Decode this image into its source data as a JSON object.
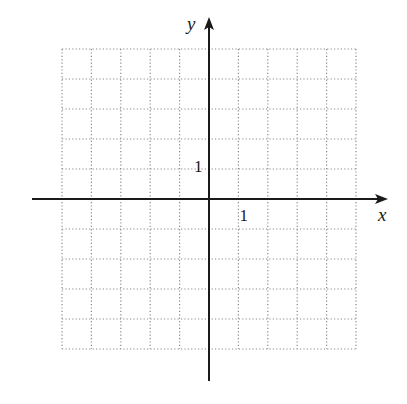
{
  "chart_data": {
    "type": "coordinate-grid",
    "title": "",
    "xlabel": "x",
    "ylabel": "y",
    "xlim": [
      -5,
      5
    ],
    "ylim": [
      -5,
      5
    ],
    "grid": true,
    "grid_style": "dotted",
    "grid_step": 1,
    "axes_extent": {
      "x": [
        -6,
        6
      ],
      "y": [
        -6,
        6
      ]
    },
    "x_tick_labels": [
      {
        "value": 1,
        "label": "1"
      }
    ],
    "y_tick_labels": [
      {
        "value": 1,
        "label": "1"
      }
    ],
    "series": []
  },
  "colors": {
    "axis": "#1a1a1a",
    "grid": "#8a8a8a",
    "background": "#ffffff"
  }
}
